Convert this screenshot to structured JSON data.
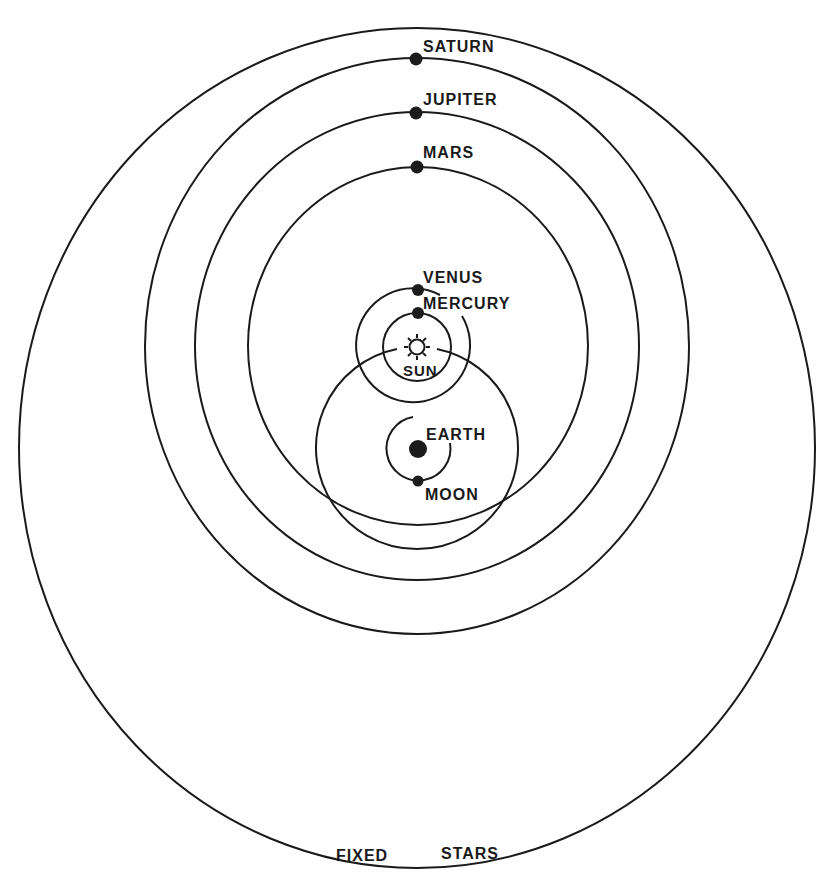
{
  "diagram": {
    "colors": {
      "ink": "#1a1a1a",
      "paper": "#ffffff"
    },
    "labels": {
      "saturn": "SATURN",
      "jupiter": "JUPITER",
      "mars": "MARS",
      "venus": "VENUS",
      "mercury": "MERCURY",
      "sun": "SUN",
      "earth": "EARTH",
      "moon": "MOON",
      "fixed": "FIXED",
      "stars": "STARS"
    },
    "centers": {
      "earth": [
        418,
        449
      ],
      "sun": [
        417,
        347
      ]
    },
    "orbits": [
      {
        "name": "fixed-stars-sphere",
        "center": "earth",
        "cx": 417,
        "cy": 448,
        "rx": 398,
        "ry": 420
      },
      {
        "name": "saturn-orbit",
        "center": "sun",
        "cx": 417,
        "cy": 346,
        "rx": 272,
        "ry": 288
      },
      {
        "name": "jupiter-orbit",
        "center": "sun",
        "cx": 417,
        "cy": 346,
        "rx": 222,
        "ry": 234
      },
      {
        "name": "mars-orbit",
        "center": "sun",
        "cx": 418,
        "cy": 346,
        "rx": 170,
        "ry": 179
      },
      {
        "name": "sun-orbit",
        "center": "earth",
        "cx": 417,
        "cy": 448,
        "r": 101
      },
      {
        "name": "venus-orbit",
        "center": "sun",
        "cx": 417,
        "cy": 347,
        "r": 57
      },
      {
        "name": "mercury-orbit",
        "center": "sun",
        "cx": 417,
        "cy": 347,
        "r": 34
      },
      {
        "name": "moon-orbit",
        "center": "earth",
        "cx": 418,
        "cy": 449,
        "r": 32
      }
    ]
  }
}
